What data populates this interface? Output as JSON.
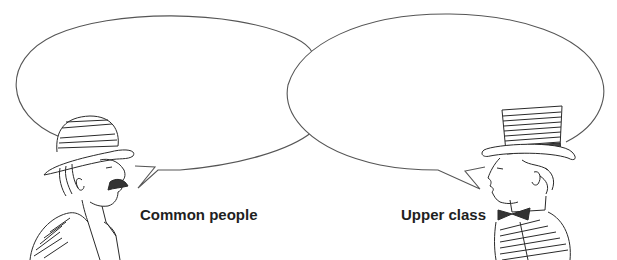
{
  "diagram": {
    "top_caption_cut_off": "",
    "speakers": [
      {
        "id": "left",
        "label": "Common people",
        "figure": "man in bowler hat with moustache, facing right",
        "bubble": {
          "cx": 165,
          "cy": 92,
          "rx": 152,
          "ry": 78,
          "text": ""
        }
      },
      {
        "id": "right",
        "label": "Upper class",
        "figure": "man in top hat and bow tie, facing left",
        "bubble": {
          "cx": 446,
          "cy": 92,
          "rx": 158,
          "ry": 78,
          "text": ""
        }
      }
    ],
    "colors": {
      "line": "#555555",
      "ink": "#2a2a2a",
      "label": "#1f1f1f",
      "background": "#ffffff"
    }
  }
}
